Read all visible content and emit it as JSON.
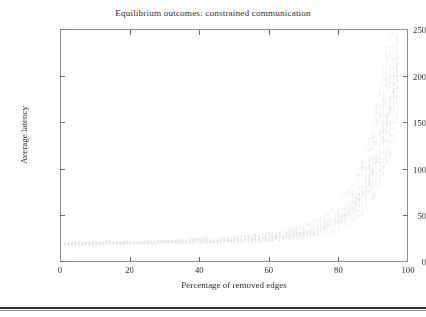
{
  "chart_data": {
    "type": "scatter",
    "title": "Equilibrium outcomes: constrained communication",
    "xlabel": "Percentage of removed edges",
    "ylabel": "Average latency",
    "xlim": [
      0,
      100
    ],
    "ylim": [
      0,
      250
    ],
    "xticks": [
      0,
      20,
      40,
      60,
      80,
      100
    ],
    "yticks": [
      0,
      50,
      100,
      150,
      200,
      250
    ],
    "grid": false,
    "legend": null,
    "marker_color": "#d8d8d8",
    "marker_size": 1,
    "series": [
      {
        "name": "Average latency samples",
        "x": [
          1,
          2,
          3,
          4,
          5,
          6,
          7,
          8,
          9,
          10,
          11,
          12,
          13,
          14,
          15,
          16,
          17,
          18,
          19,
          20,
          21,
          22,
          23,
          24,
          25,
          26,
          27,
          28,
          29,
          30,
          31,
          32,
          33,
          34,
          35,
          36,
          37,
          38,
          39,
          40,
          41,
          42,
          43,
          44,
          45,
          46,
          47,
          48,
          49,
          50,
          51,
          52,
          53,
          54,
          55,
          56,
          57,
          58,
          59,
          60,
          61,
          62,
          63,
          64,
          65,
          66,
          67,
          68,
          69,
          70,
          71,
          72,
          73,
          74,
          75,
          76,
          77,
          78,
          79,
          80,
          81,
          82,
          83,
          84,
          85,
          86,
          87,
          88,
          89,
          90,
          91,
          92,
          93,
          94,
          95,
          96,
          97
        ],
        "y": [
          19,
          19,
          19,
          19,
          19,
          19,
          19,
          19,
          19,
          19,
          19,
          19,
          20,
          20,
          20,
          20,
          20,
          20,
          20,
          20,
          20,
          20,
          20,
          20,
          20,
          20,
          20,
          21,
          21,
          21,
          21,
          21,
          21,
          21,
          21,
          21,
          21,
          21,
          22,
          22,
          22,
          22,
          22,
          22,
          22,
          22,
          23,
          23,
          23,
          23,
          23,
          23,
          24,
          24,
          24,
          24,
          24,
          25,
          25,
          25,
          26,
          26,
          26,
          27,
          27,
          28,
          28,
          29,
          30,
          30,
          31,
          32,
          33,
          34,
          35,
          37,
          38,
          40,
          42,
          44,
          47,
          50,
          53,
          57,
          62,
          67,
          73,
          80,
          88,
          97,
          108,
          120,
          134,
          149,
          166,
          184,
          200
        ],
        "y_spread": [
          2,
          2,
          2,
          2,
          2,
          2,
          2,
          2,
          2,
          2,
          2,
          2,
          2,
          2,
          2,
          2,
          2,
          2,
          2,
          2,
          2,
          2,
          2,
          2,
          2,
          2,
          2,
          2,
          2,
          2,
          2,
          2,
          2,
          2,
          3,
          3,
          3,
          3,
          3,
          3,
          3,
          3,
          3,
          3,
          3,
          3,
          3,
          3,
          3,
          3,
          3,
          4,
          4,
          4,
          4,
          4,
          4,
          4,
          4,
          5,
          5,
          5,
          5,
          5,
          6,
          6,
          6,
          7,
          7,
          7,
          8,
          8,
          9,
          9,
          10,
          11,
          12,
          13,
          14,
          15,
          17,
          18,
          20,
          22,
          25,
          27,
          30,
          34,
          38,
          42,
          47,
          52,
          58,
          64,
          70,
          76,
          82
        ]
      }
    ]
  },
  "axes": {
    "ytick_labels": [
      "250",
      "200",
      "150",
      "100",
      "50",
      "0"
    ],
    "xtick_labels": [
      "0",
      "20",
      "40",
      "60",
      "80",
      "100"
    ]
  }
}
